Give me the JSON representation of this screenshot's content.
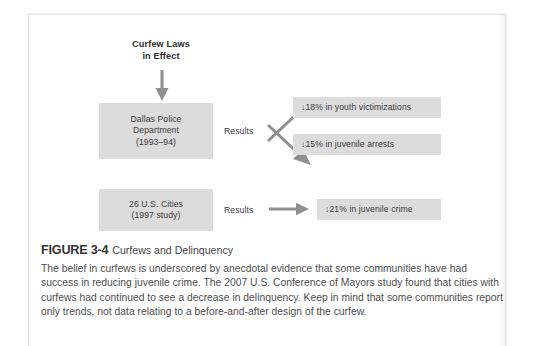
{
  "figure": {
    "top_label": "Curfew Laws\nin Effect",
    "top_label_line1": "Curfew Laws",
    "top_label_line2": "in Effect",
    "rows": [
      {
        "source_lines": [
          "Dallas Police",
          "Department",
          "(1993–94)"
        ],
        "results_label": "Results",
        "outcomes": [
          "↓18% in youth victimizations",
          "↓15% in juvenile arrests"
        ]
      },
      {
        "source_lines": [
          "26 U.S. Cities",
          "(1997 study)"
        ],
        "results_label": "Results",
        "outcomes": [
          "↓21% in juvenile crime"
        ]
      }
    ],
    "arrows": {
      "down_arrow": "down-arrow",
      "branch_up_arrow": "diagonal-up-arrow",
      "branch_down_arrow": "diagonal-down-arrow",
      "straight_arrow": "right-arrow"
    },
    "colors": {
      "box_fill": "#dcdcdc",
      "box_text": "#3b3b3b",
      "arrow": "#8c8c8c",
      "page_background": "#ffffff"
    }
  },
  "caption": {
    "figure_number": "FIGURE 3-4",
    "figure_title": "Curfews and Delinquency",
    "body": "The belief in curfews is underscored by anecdotal evidence that some communities have had success in reducing juvenile crime. The 2007 U.S. Conference of Mayors study found that cities with curfews had continued to see a decrease in delinquency. Keep in mind that some communities report only trends, not data relating to a before-and-after design of the curfew."
  }
}
